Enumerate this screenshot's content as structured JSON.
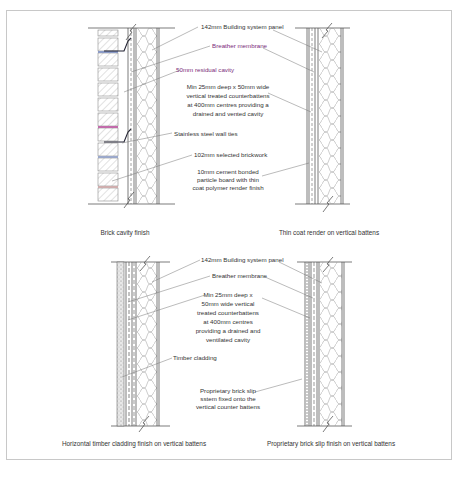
{
  "diagram": {
    "type": "wall-section-details",
    "colors": {
      "frame": "#c8c8c8",
      "line": "#444444",
      "label_text": "#333333",
      "membrane_label": "#7a2a7a",
      "brick_tie_highlight": "#b0208a",
      "brick_tie_blue": "#3a5ab0"
    },
    "sections": [
      {
        "id": "brick-cavity",
        "caption": "Brick cavity finish",
        "labels": [
          "142mm Building system panel",
          "Breather membrane",
          "50mm residual cavity",
          "Stainless steel wall ties",
          "102mm selected brickwork"
        ]
      },
      {
        "id": "thin-coat-render",
        "caption": "Thin coat render on vertical battens",
        "labels": [
          "Min 25mm deep x 50mm wide",
          "vertical treated counterbattens",
          "at 400mm centres providing a",
          "drained and vented cavity",
          "10mm cement bonded",
          "particle board with thin",
          "coat polymer render finish"
        ]
      },
      {
        "id": "timber-cladding",
        "caption": "Horizontal timber cladding finish on vertical battens",
        "labels": [
          "142mm Building system panel",
          "Breather membrane",
          "Min 25mm deep x",
          "50mm wide vertical",
          "treated counterbattens",
          "at 400mm centres",
          "providing a drained and",
          "ventilated cavity",
          "Timber cladding"
        ]
      },
      {
        "id": "brick-slip",
        "caption": "Proprietary brick slip finish on vertical battens",
        "labels": [
          "Proprietary brick slip",
          "sstem fixed onto the",
          "vertical counter battens"
        ]
      }
    ]
  }
}
